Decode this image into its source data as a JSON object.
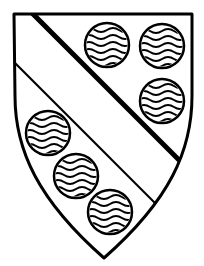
{
  "image": {
    "title": "Heraldic shield",
    "subject": "coat-of-arms escutcheon",
    "width": 204,
    "height": 266,
    "background_color": "#ffffff",
    "line_color": "#000000",
    "style": "black and white line drawing"
  },
  "shield": {
    "name": "escutcheon",
    "fill_color": "#ffffff",
    "outline_color": "#000000",
    "outline_width": 3,
    "geometry": {
      "top_left": [
        14,
        14
      ],
      "top_right": [
        192,
        14
      ],
      "bottom_point": [
        104,
        258
      ],
      "left_straight_until_y": 96,
      "right_straight_until_y": 96
    }
  },
  "ordinary": {
    "name": "bend",
    "description": "diagonal band from dexter chief to sinister base",
    "upper_edge": {
      "label": "bend-upper-edge",
      "from": [
        33,
        14
      ],
      "to": [
        190,
        171
      ],
      "stroke_width": 5
    },
    "lower_edge": {
      "label": "bend-lower-edge",
      "from": [
        15,
        62
      ],
      "to": [
        156,
        204
      ],
      "stroke_width": 2
    }
  },
  "charges": {
    "name": "fountains",
    "description": "roundels barry wavy",
    "count": 6,
    "radius": 22,
    "wave_count": 6,
    "wave_stroke_width": 2,
    "items": [
      {
        "id": "roundel-chief-1",
        "position": "chief dexter",
        "cx": 107,
        "cy": 45,
        "r": 22
      },
      {
        "id": "roundel-chief-2",
        "position": "chief sinister",
        "cx": 162,
        "cy": 46,
        "r": 22
      },
      {
        "id": "roundel-flank-3",
        "position": "sinister flank",
        "cx": 162,
        "cy": 101,
        "r": 22
      },
      {
        "id": "roundel-base-4",
        "position": "dexter flank",
        "cx": 48,
        "cy": 133,
        "r": 22
      },
      {
        "id": "roundel-base-5",
        "position": "dexter base",
        "cx": 76,
        "cy": 176,
        "r": 22
      },
      {
        "id": "roundel-base-6",
        "position": "base",
        "cx": 110,
        "cy": 212,
        "r": 22
      }
    ]
  }
}
